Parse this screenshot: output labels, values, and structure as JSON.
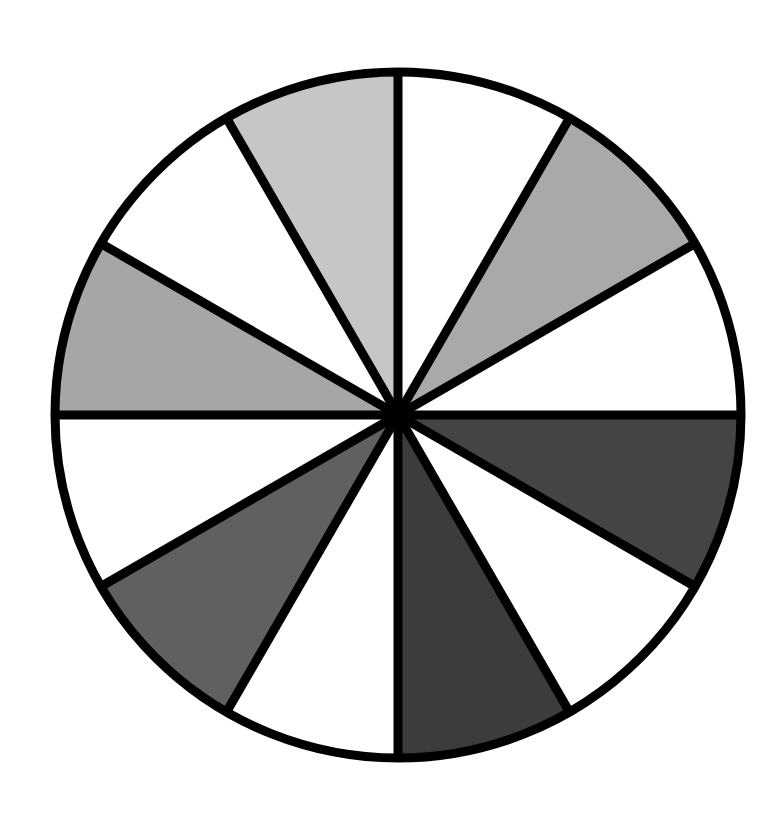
{
  "diagram": {
    "type": "fraction-circle",
    "center": [
      398,
      415
    ],
    "radius": 343,
    "stroke_color": "#000000",
    "stroke_width": 9,
    "sector_count": 12,
    "sectors": [
      {
        "index": 0,
        "start_deg": 0,
        "end_deg": 30,
        "fill": "#ffffff",
        "shade": "white"
      },
      {
        "index": 1,
        "start_deg": 30,
        "end_deg": 60,
        "fill": "#a9a9a9",
        "shade": "medium-gray"
      },
      {
        "index": 2,
        "start_deg": 60,
        "end_deg": 90,
        "fill": "#ffffff",
        "shade": "white"
      },
      {
        "index": 3,
        "start_deg": 90,
        "end_deg": 120,
        "fill": "#444444",
        "shade": "dark-gray"
      },
      {
        "index": 4,
        "start_deg": 120,
        "end_deg": 150,
        "fill": "#ffffff",
        "shade": "white"
      },
      {
        "index": 5,
        "start_deg": 150,
        "end_deg": 180,
        "fill": "#3c3c3c",
        "shade": "dark-gray"
      },
      {
        "index": 6,
        "start_deg": 180,
        "end_deg": 210,
        "fill": "#ffffff",
        "shade": "white"
      },
      {
        "index": 7,
        "start_deg": 210,
        "end_deg": 240,
        "fill": "#606060",
        "shade": "gray"
      },
      {
        "index": 8,
        "start_deg": 240,
        "end_deg": 270,
        "fill": "#ffffff",
        "shade": "white"
      },
      {
        "index": 9,
        "start_deg": 270,
        "end_deg": 300,
        "fill": "#a6a6a6",
        "shade": "medium-gray"
      },
      {
        "index": 10,
        "start_deg": 300,
        "end_deg": 330,
        "fill": "#ffffff",
        "shade": "white"
      },
      {
        "index": 11,
        "start_deg": 330,
        "end_deg": 360,
        "fill": "#c6c6c6",
        "shade": "light-gray"
      }
    ],
    "counts": {
      "total": 12,
      "white": 6,
      "shaded": 6
    }
  }
}
